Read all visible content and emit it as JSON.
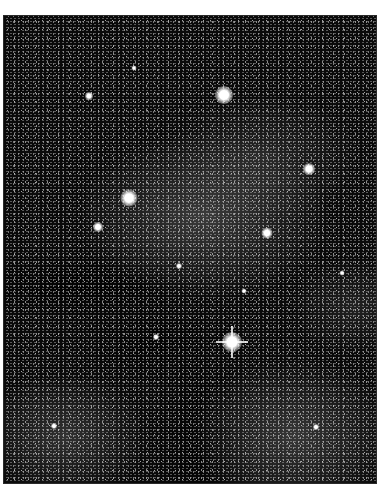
{
  "image": {
    "subject": "Milky Way star field with bright stars and dark dust lanes",
    "palette": {
      "sky": "#0a0a0a",
      "star": "#ffffff",
      "background": "#ffffff"
    }
  },
  "bright_stars": [
    {
      "x": 220,
      "y": 79,
      "size": 18
    },
    {
      "x": 305,
      "y": 153,
      "size": 12
    },
    {
      "x": 125,
      "y": 182,
      "size": 17
    },
    {
      "x": 94,
      "y": 211,
      "size": 10
    },
    {
      "x": 263,
      "y": 217,
      "size": 11
    },
    {
      "x": 228,
      "y": 326,
      "size": 20,
      "spikes": true
    },
    {
      "x": 85,
      "y": 80,
      "size": 8
    },
    {
      "x": 130,
      "y": 52,
      "size": 5
    },
    {
      "x": 152,
      "y": 321,
      "size": 6
    },
    {
      "x": 312,
      "y": 411,
      "size": 6
    },
    {
      "x": 338,
      "y": 257,
      "size": 5
    },
    {
      "x": 50,
      "y": 410,
      "size": 6
    },
    {
      "x": 175,
      "y": 250,
      "size": 6
    },
    {
      "x": 240,
      "y": 275,
      "size": 5
    }
  ]
}
